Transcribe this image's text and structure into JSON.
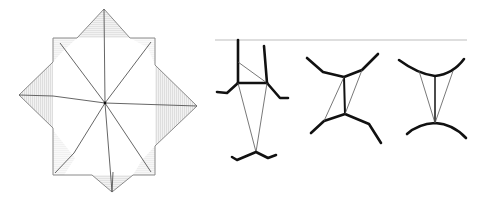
{
  "diagram": {
    "type": "line-drawing",
    "panels": [
      {
        "id": "folded-star",
        "description": "Eight-pointed folded paper star: square with four triangular flaps (top, right, bottom, left) and eight creases radiating from center",
        "square": [
          [
            53,
            38
          ],
          [
            155,
            38
          ],
          [
            155,
            175
          ],
          [
            53,
            175
          ]
        ],
        "peaks": {
          "top": [
            104,
            9
          ],
          "right": [
            197,
            106
          ],
          "bottom": [
            112,
            192
          ],
          "left": [
            19,
            95
          ]
        },
        "center": [
          105,
          103
        ],
        "colors": {
          "outline": "#8a8a8a",
          "crease": "#555555",
          "hatch": "#b0b0b0"
        }
      },
      {
        "id": "linkage-figure-1",
        "description": "Hanging linkage with vertical supports from baseline, triangle brace and V-shaped lower member"
      },
      {
        "id": "linkage-figure-2",
        "description": "Two curved thick members connected by a vertical strut and two thin diagonal ties (parallelogram)"
      },
      {
        "id": "linkage-figure-3",
        "description": "Two curved thick members connected by a vertical strut and two converging thin ties"
      }
    ],
    "baseline": {
      "from": [
        215,
        40
      ],
      "to": [
        467,
        40
      ],
      "color": "#bdbdbd"
    }
  }
}
